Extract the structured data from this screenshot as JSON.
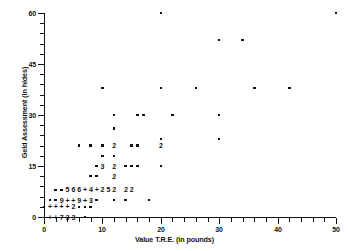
{
  "chart_data": {
    "type": "scatter",
    "title": "",
    "xlabel": "Value T.R.E. (in pounds)",
    "ylabel": "Geld Assessment (in hides)",
    "xlim": [
      0,
      50
    ],
    "ylim": [
      0,
      60
    ],
    "xticks": [
      0,
      10,
      20,
      30,
      40,
      50
    ],
    "xticklabels": [
      "0",
      "10",
      "20",
      "30",
      "40",
      "50"
    ],
    "yticks": [
      0,
      15,
      30,
      45,
      60
    ],
    "yticklabels": [
      "0",
      "15",
      "30",
      "45",
      "60"
    ],
    "x_minor_tick_interval": 2,
    "y_minor_tick_interval": 3,
    "grid": false,
    "legend": false,
    "marker": "square-dot",
    "overplot_notation": "Digits and '+' mark coincident observations: a digit is the number of points at that location; '+' marks a location with more points than a single digit can show.",
    "points": [
      {
        "x": 20,
        "y": 60,
        "label": "",
        "n": 1
      },
      {
        "x": 50,
        "y": 60,
        "label": "",
        "n": 1
      },
      {
        "x": 30,
        "y": 52,
        "label": "",
        "n": 1
      },
      {
        "x": 34,
        "y": 52,
        "label": "",
        "n": 1
      },
      {
        "x": 20,
        "y": 38,
        "label": "",
        "n": 1
      },
      {
        "x": 26,
        "y": 38,
        "label": "",
        "n": 1
      },
      {
        "x": 36,
        "y": 38,
        "label": "",
        "n": 1
      },
      {
        "x": 42,
        "y": 38,
        "label": "",
        "n": 1
      },
      {
        "x": 10,
        "y": 38,
        "label": "",
        "n": 1
      },
      {
        "x": 16,
        "y": 30,
        "label": "",
        "n": 1
      },
      {
        "x": 17,
        "y": 30,
        "label": "",
        "n": 1
      },
      {
        "x": 22,
        "y": 30,
        "label": "",
        "n": 1
      },
      {
        "x": 30,
        "y": 30,
        "label": "",
        "n": 1
      },
      {
        "x": 12,
        "y": 30,
        "label": "",
        "n": 1
      },
      {
        "x": 12,
        "y": 26,
        "label": "",
        "n": 1
      },
      {
        "x": 20,
        "y": 23,
        "label": "",
        "n": 1
      },
      {
        "x": 30,
        "y": 23,
        "label": "",
        "n": 1
      },
      {
        "x": 8,
        "y": 21,
        "label": "",
        "n": 1
      },
      {
        "x": 10,
        "y": 21,
        "label": "",
        "n": 1
      },
      {
        "x": 12,
        "y": 21,
        "label": "2",
        "n": 2
      },
      {
        "x": 15,
        "y": 21,
        "label": "",
        "n": 1
      },
      {
        "x": 16,
        "y": 21,
        "label": "",
        "n": 1
      },
      {
        "x": 20,
        "y": 21,
        "label": "2",
        "n": 2
      },
      {
        "x": 6,
        "y": 21,
        "label": "",
        "n": 1
      },
      {
        "x": 10,
        "y": 18,
        "label": "",
        "n": 1
      },
      {
        "x": 12,
        "y": 18,
        "label": "",
        "n": 1
      },
      {
        "x": 10,
        "y": 15,
        "label": "3",
        "n": 3
      },
      {
        "x": 12,
        "y": 15,
        "label": "2",
        "n": 2
      },
      {
        "x": 14,
        "y": 15,
        "label": "",
        "n": 1
      },
      {
        "x": 15,
        "y": 15,
        "label": "",
        "n": 1
      },
      {
        "x": 16,
        "y": 15,
        "label": "",
        "n": 1
      },
      {
        "x": 20,
        "y": 15,
        "label": "",
        "n": 1
      },
      {
        "x": 9,
        "y": 15,
        "label": "",
        "n": 1
      },
      {
        "x": 8,
        "y": 12,
        "label": "",
        "n": 1
      },
      {
        "x": 9,
        "y": 12,
        "label": "",
        "n": 1
      },
      {
        "x": 12,
        "y": 12,
        "label": "2",
        "n": 2
      },
      {
        "x": 2,
        "y": 8,
        "label": "",
        "n": 1
      },
      {
        "x": 3,
        "y": 8,
        "label": "",
        "n": 1
      },
      {
        "x": 4,
        "y": 8,
        "label": "5",
        "n": 5
      },
      {
        "x": 5,
        "y": 8,
        "label": "6",
        "n": 6
      },
      {
        "x": 6,
        "y": 8,
        "label": "6",
        "n": 6
      },
      {
        "x": 7,
        "y": 8,
        "label": "+",
        "n": 10
      },
      {
        "x": 8,
        "y": 8,
        "label": "4",
        "n": 4
      },
      {
        "x": 9,
        "y": 8,
        "label": "+",
        "n": 10
      },
      {
        "x": 10,
        "y": 8,
        "label": "2",
        "n": 2
      },
      {
        "x": 11,
        "y": 8,
        "label": "5",
        "n": 5
      },
      {
        "x": 12,
        "y": 8,
        "label": "2",
        "n": 2
      },
      {
        "x": 14,
        "y": 8,
        "label": "2",
        "n": 2
      },
      {
        "x": 15,
        "y": 8,
        "label": "2",
        "n": 2
      },
      {
        "x": 1,
        "y": 5,
        "label": "",
        "n": 1
      },
      {
        "x": 2,
        "y": 5,
        "label": "",
        "n": 1
      },
      {
        "x": 3,
        "y": 5,
        "label": "9",
        "n": 9
      },
      {
        "x": 4,
        "y": 5,
        "label": "+",
        "n": 10
      },
      {
        "x": 5,
        "y": 5,
        "label": "+",
        "n": 10
      },
      {
        "x": 6,
        "y": 5,
        "label": "9",
        "n": 9
      },
      {
        "x": 7,
        "y": 5,
        "label": "+",
        "n": 10
      },
      {
        "x": 8,
        "y": 5,
        "label": "3",
        "n": 3
      },
      {
        "x": 9,
        "y": 5,
        "label": "",
        "n": 1
      },
      {
        "x": 12,
        "y": 5,
        "label": "",
        "n": 1
      },
      {
        "x": 14,
        "y": 5,
        "label": "",
        "n": 1
      },
      {
        "x": 18,
        "y": 5,
        "label": "",
        "n": 1
      },
      {
        "x": 0,
        "y": 3,
        "label": "",
        "n": 1
      },
      {
        "x": 1,
        "y": 3,
        "label": "+",
        "n": 10
      },
      {
        "x": 2,
        "y": 3,
        "label": "+",
        "n": 10
      },
      {
        "x": 3,
        "y": 3,
        "label": "+",
        "n": 10
      },
      {
        "x": 4,
        "y": 3,
        "label": "+",
        "n": 10
      },
      {
        "x": 5,
        "y": 3,
        "label": "2",
        "n": 2
      },
      {
        "x": 6,
        "y": 3,
        "label": "",
        "n": 1
      },
      {
        "x": 7,
        "y": 3,
        "label": "",
        "n": 1
      },
      {
        "x": 8,
        "y": 3,
        "label": "",
        "n": 1
      },
      {
        "x": 1,
        "y": 0,
        "label": "+",
        "n": 10
      },
      {
        "x": 2,
        "y": 0,
        "label": "+",
        "n": 10
      },
      {
        "x": 3,
        "y": 0,
        "label": "7",
        "n": 7
      },
      {
        "x": 4,
        "y": 0,
        "label": "3",
        "n": 3
      },
      {
        "x": 5,
        "y": 0,
        "label": "3",
        "n": 3
      },
      {
        "x": 7,
        "y": 0,
        "label": "",
        "n": 1
      }
    ]
  }
}
